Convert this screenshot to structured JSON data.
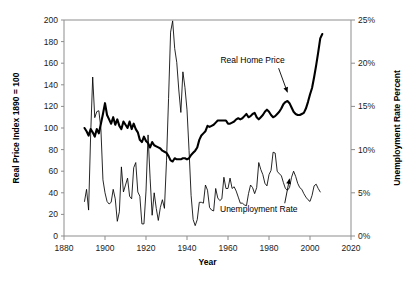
{
  "chart_data": {
    "type": "line",
    "title": "",
    "xlabel": "Year",
    "ylabel": "Real Price Index 1890 = 100",
    "y2label": "Unemployment Rate Percent",
    "xlim": [
      1880,
      2020
    ],
    "ylim": [
      0,
      200
    ],
    "y2lim": [
      0,
      25
    ],
    "grid": false,
    "legend": "annotations-on-plot",
    "xticks": [
      "1880",
      "1900",
      "1920",
      "1940",
      "1960",
      "1980",
      "2000",
      "2020"
    ],
    "xtick_values": [
      1880,
      1900,
      1920,
      1940,
      1960,
      1980,
      2000,
      2020
    ],
    "yticks": [
      "0",
      "20",
      "40",
      "60",
      "80",
      "100",
      "120",
      "140",
      "160",
      "180",
      "200"
    ],
    "ytick_values": [
      0,
      20,
      40,
      60,
      80,
      100,
      120,
      140,
      160,
      180,
      200
    ],
    "y2ticks": [
      "0%",
      "5%",
      "10%",
      "15%",
      "20%",
      "25%"
    ],
    "y2tick_values": [
      0,
      5,
      10,
      15,
      20,
      25
    ],
    "annotations": [
      {
        "text": "Real Home Price",
        "x": 1972,
        "y": 160,
        "arrow_to_x": 1989,
        "arrow_to_y": 133
      },
      {
        "text": "Unemployment Rate",
        "x": 1975,
        "y": 22,
        "arrow_to_x": 1990,
        "arrow_to_y": 53
      }
    ],
    "series": [
      {
        "name": "Real Home Price",
        "axis": "left",
        "units": "Real Price Index 1890 = 100",
        "style": "thick",
        "x": [
          1890,
          1891,
          1892,
          1893,
          1894,
          1895,
          1896,
          1897,
          1898,
          1899,
          1900,
          1901,
          1902,
          1903,
          1904,
          1905,
          1906,
          1907,
          1908,
          1909,
          1910,
          1911,
          1912,
          1913,
          1914,
          1915,
          1916,
          1917,
          1918,
          1919,
          1920,
          1921,
          1922,
          1923,
          1924,
          1925,
          1926,
          1927,
          1928,
          1929,
          1930,
          1931,
          1932,
          1933,
          1934,
          1935,
          1936,
          1937,
          1938,
          1939,
          1940,
          1941,
          1942,
          1943,
          1944,
          1945,
          1946,
          1947,
          1948,
          1949,
          1950,
          1951,
          1952,
          1953,
          1954,
          1955,
          1956,
          1957,
          1958,
          1959,
          1960,
          1961,
          1962,
          1963,
          1964,
          1965,
          1966,
          1967,
          1968,
          1969,
          1970,
          1971,
          1972,
          1973,
          1974,
          1975,
          1976,
          1977,
          1978,
          1979,
          1980,
          1981,
          1982,
          1983,
          1984,
          1985,
          1986,
          1987,
          1988,
          1989,
          1990,
          1991,
          1992,
          1993,
          1994,
          1995,
          1996,
          1997,
          1998,
          1999,
          2000,
          2001,
          2002,
          2003,
          2004,
          2005,
          2006
        ],
        "values": [
          100,
          97,
          93,
          99,
          96,
          92,
          99,
          95,
          104,
          113,
          123,
          112,
          108,
          104,
          110,
          103,
          108,
          102,
          99,
          106,
          103,
          100,
          106,
          99,
          104,
          99,
          96,
          89,
          87,
          92,
          88,
          86,
          82,
          87,
          84,
          83,
          82,
          81,
          79,
          78,
          77,
          74,
          70,
          69,
          72,
          71,
          71,
          71,
          72,
          72,
          71,
          72,
          75,
          77,
          79,
          82,
          89,
          93,
          95,
          97,
          102,
          101,
          102,
          103,
          105,
          107,
          107,
          107,
          107,
          107,
          104,
          104,
          105,
          106,
          108,
          109,
          108,
          109,
          111,
          113,
          110,
          111,
          113,
          114,
          110,
          108,
          110,
          112,
          115,
          117,
          115,
          112,
          110,
          111,
          113,
          115,
          118,
          122,
          124,
          125,
          123,
          119,
          115,
          113,
          112,
          112,
          113,
          114,
          118,
          124,
          131,
          137,
          147,
          158,
          170,
          183,
          187
        ]
      },
      {
        "name": "Unemployment Rate",
        "axis": "right",
        "units": "percent",
        "style": "thin",
        "x": [
          1890,
          1891,
          1892,
          1893,
          1894,
          1895,
          1896,
          1897,
          1898,
          1899,
          1900,
          1901,
          1902,
          1903,
          1904,
          1905,
          1906,
          1907,
          1908,
          1909,
          1910,
          1911,
          1912,
          1913,
          1914,
          1915,
          1916,
          1917,
          1918,
          1919,
          1920,
          1921,
          1922,
          1923,
          1924,
          1925,
          1926,
          1927,
          1928,
          1929,
          1930,
          1931,
          1932,
          1933,
          1934,
          1935,
          1936,
          1937,
          1938,
          1939,
          1940,
          1941,
          1942,
          1943,
          1944,
          1945,
          1946,
          1947,
          1948,
          1949,
          1950,
          1951,
          1952,
          1953,
          1954,
          1955,
          1956,
          1957,
          1958,
          1959,
          1960,
          1961,
          1962,
          1963,
          1964,
          1965,
          1966,
          1967,
          1968,
          1969,
          1970,
          1971,
          1972,
          1973,
          1974,
          1975,
          1976,
          1977,
          1978,
          1979,
          1980,
          1981,
          1982,
          1983,
          1984,
          1985,
          1986,
          1987,
          1988,
          1989,
          1990,
          1991,
          1992,
          1993,
          1994,
          1995,
          1996,
          1997,
          1998,
          1999,
          2000,
          2001,
          2002,
          2003,
          2004,
          2005
        ],
        "values": [
          4.0,
          5.4,
          3.0,
          11.7,
          18.4,
          13.7,
          14.4,
          14.5,
          12.4,
          6.5,
          5.0,
          4.0,
          3.7,
          3.9,
          5.4,
          4.3,
          1.7,
          2.8,
          8.0,
          5.1,
          5.9,
          6.7,
          4.6,
          4.3,
          7.9,
          8.5,
          5.1,
          4.6,
          1.4,
          1.4,
          5.2,
          11.7,
          6.7,
          2.4,
          5.0,
          3.2,
          1.8,
          3.3,
          4.2,
          3.2,
          8.7,
          15.9,
          23.6,
          24.9,
          21.7,
          20.1,
          16.9,
          14.3,
          19.0,
          17.2,
          14.6,
          9.9,
          4.7,
          1.9,
          1.2,
          1.9,
          3.9,
          3.9,
          3.8,
          5.9,
          5.3,
          3.3,
          3.0,
          2.9,
          5.5,
          4.4,
          4.1,
          4.3,
          6.8,
          5.5,
          5.5,
          6.7,
          5.5,
          5.7,
          5.2,
          4.5,
          3.8,
          3.8,
          3.6,
          3.5,
          4.9,
          5.9,
          5.6,
          4.9,
          5.6,
          8.5,
          7.7,
          7.1,
          6.1,
          5.8,
          7.1,
          7.6,
          9.7,
          9.6,
          7.5,
          7.2,
          7.0,
          6.2,
          5.5,
          5.3,
          5.6,
          6.8,
          7.5,
          6.9,
          6.1,
          5.6,
          5.4,
          4.9,
          4.5,
          4.2,
          4.0,
          4.7,
          5.8,
          6.0,
          5.5,
          5.1
        ]
      }
    ]
  }
}
